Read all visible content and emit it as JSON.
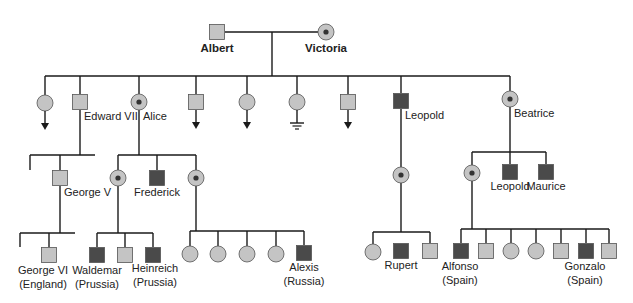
{
  "colors": {
    "line": "#1a1a1a",
    "unaffected_fill": "#c4c4c4",
    "affected_fill": "#4a4a4a",
    "carrier_outer": "#c4c4c4",
    "carrier_dot": "#333333",
    "border": "#555555"
  },
  "legend_semantics": {
    "square": "male",
    "circle": "female",
    "dark-square": "affected male",
    "dotted-circle": "carrier female",
    "arrow-down": "descendants not shown",
    "ground-symbol": "no offspring"
  },
  "individuals": [
    {
      "id": "albert",
      "sex": "male",
      "status": "unaffected",
      "x": 217,
      "y": 32,
      "label": [
        "Albert"
      ],
      "label_x": 217,
      "label_y": 52,
      "bold": true,
      "anchor": "middle"
    },
    {
      "id": "victoria",
      "sex": "female",
      "status": "carrier",
      "x": 326,
      "y": 32,
      "label": [
        "Victoria"
      ],
      "label_x": 326,
      "label_y": 52,
      "bold": true,
      "anchor": "middle"
    },
    {
      "id": "gen2-daughter-1",
      "sex": "female",
      "status": "unaffected",
      "x": 45,
      "y": 103,
      "marker": "arrow"
    },
    {
      "id": "edward-vii",
      "sex": "male",
      "status": "unaffected",
      "x": 80,
      "y": 102,
      "label": [
        "Edward VII"
      ],
      "label_x": 84,
      "label_y": 120,
      "anchor": "start"
    },
    {
      "id": "alice",
      "sex": "female",
      "status": "carrier",
      "x": 139,
      "y": 102,
      "label": [
        "Alice"
      ],
      "label_x": 143,
      "label_y": 120,
      "anchor": "start"
    },
    {
      "id": "gen2-son-1",
      "sex": "male",
      "status": "unaffected",
      "x": 196,
      "y": 102,
      "marker": "arrow"
    },
    {
      "id": "gen2-daughter-2",
      "sex": "female",
      "status": "unaffected",
      "x": 247,
      "y": 102,
      "marker": "arrow"
    },
    {
      "id": "gen2-daughter-3",
      "sex": "female",
      "status": "unaffected",
      "x": 297,
      "y": 102,
      "marker": "ground"
    },
    {
      "id": "gen2-son-2",
      "sex": "male",
      "status": "unaffected",
      "x": 348,
      "y": 102,
      "marker": "arrow"
    },
    {
      "id": "leopold",
      "sex": "male",
      "status": "affected",
      "x": 401,
      "y": 101,
      "label": [
        "Leopold"
      ],
      "label_x": 405,
      "label_y": 119,
      "anchor": "start"
    },
    {
      "id": "beatrice",
      "sex": "female",
      "status": "carrier",
      "x": 510,
      "y": 99,
      "label": [
        "Beatrice"
      ],
      "label_x": 514,
      "label_y": 117,
      "anchor": "start"
    },
    {
      "id": "george-v",
      "sex": "male",
      "status": "unaffected",
      "x": 60,
      "y": 178,
      "label": [
        "George V"
      ],
      "label_x": 64,
      "label_y": 196,
      "anchor": "start"
    },
    {
      "id": "alice-daughter-1",
      "sex": "female",
      "status": "carrier",
      "x": 118,
      "y": 178
    },
    {
      "id": "frederick",
      "sex": "male",
      "status": "affected",
      "x": 157,
      "y": 178,
      "label": [
        "Frederick"
      ],
      "label_x": 157,
      "label_y": 196,
      "anchor": "middle"
    },
    {
      "id": "alice-daughter-2",
      "sex": "female",
      "status": "carrier",
      "x": 196,
      "y": 178
    },
    {
      "id": "leopold-daughter",
      "sex": "female",
      "status": "carrier",
      "x": 401,
      "y": 175
    },
    {
      "id": "beatrice-daughter",
      "sex": "female",
      "status": "carrier",
      "x": 472,
      "y": 173
    },
    {
      "id": "leopold-b",
      "sex": "male",
      "status": "affected",
      "x": 510,
      "y": 172,
      "label": [
        "Leopold"
      ],
      "label_x": 510,
      "label_y": 190,
      "anchor": "middle"
    },
    {
      "id": "maurice",
      "sex": "male",
      "status": "affected",
      "x": 546,
      "y": 172,
      "label": [
        "Maurice"
      ],
      "label_x": 546,
      "label_y": 190,
      "anchor": "middle"
    },
    {
      "id": "george-vi",
      "sex": "male",
      "status": "unaffected",
      "x": 49,
      "y": 255,
      "label": [
        "George VI",
        "(England)"
      ],
      "label_x": 43,
      "label_y": 274,
      "anchor": "middle"
    },
    {
      "id": "waldemar",
      "sex": "male",
      "status": "affected",
      "x": 97,
      "y": 255,
      "label": [
        "Waldemar",
        "(Prussia)"
      ],
      "label_x": 97,
      "label_y": 274,
      "anchor": "middle"
    },
    {
      "id": "alice-gc-son",
      "sex": "male",
      "status": "unaffected",
      "x": 125,
      "y": 255
    },
    {
      "id": "heinreich",
      "sex": "male",
      "status": "affected",
      "x": 153,
      "y": 255,
      "label": [
        "Heinreich",
        "(Prussia)"
      ],
      "label_x": 155,
      "label_y": 272,
      "anchor": "middle"
    },
    {
      "id": "russia-daughter-1",
      "sex": "female",
      "status": "unaffected",
      "x": 190,
      "y": 254
    },
    {
      "id": "russia-daughter-2",
      "sex": "female",
      "status": "unaffected",
      "x": 218,
      "y": 254
    },
    {
      "id": "russia-daughter-3",
      "sex": "female",
      "status": "unaffected",
      "x": 247,
      "y": 254
    },
    {
      "id": "russia-daughter-4",
      "sex": "female",
      "status": "unaffected",
      "x": 276,
      "y": 254
    },
    {
      "id": "alexis",
      "sex": "male",
      "status": "affected",
      "x": 304,
      "y": 253,
      "label": [
        "Alexis",
        "(Russia)"
      ],
      "label_x": 304,
      "label_y": 271,
      "anchor": "middle"
    },
    {
      "id": "rupert-sister",
      "sex": "female",
      "status": "unaffected",
      "x": 373,
      "y": 252
    },
    {
      "id": "rupert",
      "sex": "male",
      "status": "affected",
      "x": 401,
      "y": 251,
      "label": [
        "Rupert"
      ],
      "label_x": 401,
      "label_y": 269,
      "anchor": "middle"
    },
    {
      "id": "rupert-brother",
      "sex": "male",
      "status": "unaffected",
      "x": 430,
      "y": 251
    },
    {
      "id": "alfonso",
      "sex": "male",
      "status": "affected",
      "x": 461,
      "y": 251,
      "label": [
        "Alfonso",
        "(Spain)"
      ],
      "label_x": 460,
      "label_y": 270,
      "anchor": "middle"
    },
    {
      "id": "spain-son-1",
      "sex": "male",
      "status": "unaffected",
      "x": 486,
      "y": 251
    },
    {
      "id": "spain-daughter-1",
      "sex": "female",
      "status": "unaffected",
      "x": 511,
      "y": 251
    },
    {
      "id": "spain-daughter-2",
      "sex": "female",
      "status": "unaffected",
      "x": 536,
      "y": 251
    },
    {
      "id": "spain-son-2",
      "sex": "male",
      "status": "unaffected",
      "x": 561,
      "y": 251
    },
    {
      "id": "gonzalo",
      "sex": "male",
      "status": "affected",
      "x": 586,
      "y": 251,
      "label": [
        "Gonzalo",
        "(Spain)"
      ],
      "label_x": 585,
      "label_y": 270,
      "anchor": "middle"
    },
    {
      "id": "spain-son-3",
      "sex": "male",
      "status": "unaffected",
      "x": 609,
      "y": 251
    }
  ],
  "lines": [
    [
      225,
      32,
      318,
      32
    ],
    [
      272,
      32,
      272,
      76
    ],
    [
      45,
      76,
      510,
      76
    ],
    [
      45,
      76,
      45,
      95
    ],
    [
      80,
      76,
      80,
      94
    ],
    [
      139,
      76,
      139,
      94
    ],
    [
      196,
      76,
      196,
      94
    ],
    [
      247,
      76,
      247,
      94
    ],
    [
      297,
      76,
      297,
      94
    ],
    [
      348,
      76,
      348,
      94
    ],
    [
      401,
      76,
      401,
      93
    ],
    [
      510,
      76,
      510,
      91
    ],
    [
      80,
      110,
      80,
      155
    ],
    [
      30,
      155,
      95,
      155
    ],
    [
      30,
      155,
      30,
      170
    ],
    [
      60,
      155,
      60,
      170
    ],
    [
      139,
      110,
      139,
      155
    ],
    [
      118,
      155,
      196,
      155
    ],
    [
      118,
      155,
      118,
      170
    ],
    [
      157,
      155,
      157,
      170
    ],
    [
      196,
      155,
      196,
      170
    ],
    [
      401,
      109,
      401,
      167
    ],
    [
      401,
      183,
      401,
      232
    ],
    [
      373,
      232,
      430,
      232
    ],
    [
      373,
      232,
      373,
      244
    ],
    [
      430,
      232,
      430,
      243
    ],
    [
      510,
      107,
      510,
      152
    ],
    [
      472,
      152,
      546,
      152
    ],
    [
      472,
      152,
      472,
      165
    ],
    [
      510,
      152,
      510,
      164
    ],
    [
      546,
      152,
      546,
      164
    ],
    [
      472,
      181,
      472,
      229
    ],
    [
      461,
      229,
      609,
      229
    ],
    [
      461,
      229,
      461,
      243
    ],
    [
      486,
      229,
      486,
      243
    ],
    [
      511,
      229,
      511,
      243
    ],
    [
      536,
      229,
      536,
      243
    ],
    [
      561,
      229,
      561,
      243
    ],
    [
      586,
      229,
      586,
      243
    ],
    [
      609,
      229,
      609,
      243
    ],
    [
      60,
      186,
      60,
      233
    ],
    [
      20,
      233,
      75,
      233
    ],
    [
      20,
      233,
      20,
      247
    ],
    [
      49,
      233,
      49,
      247
    ],
    [
      118,
      186,
      118,
      233
    ],
    [
      97,
      233,
      153,
      233
    ],
    [
      97,
      233,
      97,
      247
    ],
    [
      125,
      233,
      125,
      247
    ],
    [
      153,
      233,
      153,
      247
    ],
    [
      196,
      186,
      196,
      231
    ],
    [
      190,
      231,
      304,
      231
    ],
    [
      190,
      231,
      190,
      246
    ],
    [
      218,
      231,
      218,
      246
    ],
    [
      247,
      231,
      247,
      246
    ],
    [
      276,
      231,
      276,
      246
    ],
    [
      304,
      231,
      304,
      245
    ]
  ]
}
